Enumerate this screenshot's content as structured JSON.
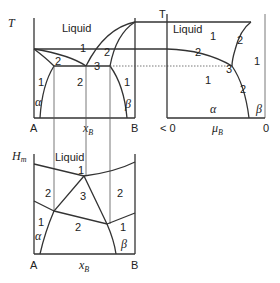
{
  "figure": {
    "top_left": {
      "y_axis_label": "T",
      "x_axis_label": "x",
      "x_axis_label_sub": "B",
      "left_end_label": "A",
      "right_end_label": "B",
      "region_labels": {
        "liquid": "Liquid",
        "r1_top": "1",
        "r2_left": "2",
        "r2_right": "2",
        "r3": "3",
        "r2_mid": "2",
        "r1_left": "1",
        "r1_right": "1",
        "alpha": "α",
        "beta": "β"
      }
    },
    "top_right": {
      "y_axis_label": "T",
      "x_axis_label": "μ",
      "x_axis_label_sub": "B",
      "left_end_label": "< 0",
      "right_end_label": "0",
      "region_labels": {
        "liquid": "Liquid",
        "r1_liquid": "1",
        "r2_upper": "2",
        "r2_liquid_alpha": "2",
        "r3": "3",
        "r1_alpha": "1",
        "r1_beta": "1",
        "r2_lower": "2",
        "alpha": "α",
        "beta": "β"
      }
    },
    "bottom": {
      "y_axis_label": "H",
      "y_axis_label_sub": "m",
      "x_axis_label": "x",
      "x_axis_label_sub": "B",
      "left_end_label": "A",
      "right_end_label": "B",
      "region_labels": {
        "liquid": "Liquid",
        "r1_top": "1",
        "r2_left": "2",
        "r3": "3",
        "r2_right": "2",
        "r1_left": "1",
        "r2_bottom": "2",
        "r1_right": "1",
        "alpha": "α",
        "beta": "β"
      }
    }
  }
}
